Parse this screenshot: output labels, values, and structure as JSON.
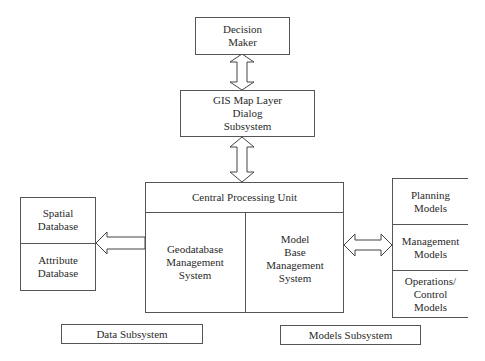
{
  "diagram": {
    "decision_maker": {
      "line1": "Decision",
      "line2": "Maker"
    },
    "gis_dialog": {
      "line1": "GIS Map Layer",
      "line2": "Dialog",
      "line3": "Subsystem"
    },
    "cpu": {
      "title": "Central Processing Unit",
      "left": {
        "line1": "Geodatabase",
        "line2": "Management",
        "line3": "System"
      },
      "right": {
        "line1": "Model",
        "line2": "Base",
        "line3": "Management",
        "line4": "System"
      }
    },
    "databases": [
      {
        "line1": "Spatial",
        "line2": "Database"
      },
      {
        "line1": "Attribute",
        "line2": "Database"
      }
    ],
    "models": [
      {
        "line1": "Planning",
        "line2": "Models"
      },
      {
        "line1": "Management",
        "line2": "Models"
      },
      {
        "line1": "Operations/",
        "line2": "Control",
        "line3": "Models"
      }
    ],
    "labels": {
      "data_subsystem": "Data Subsystem",
      "models_subsystem": "Models Subsystem"
    },
    "connectors": [
      {
        "from": "Decision Maker",
        "to": "GIS Map Layer Dialog Subsystem",
        "type": "double-arrow"
      },
      {
        "from": "GIS Map Layer Dialog Subsystem",
        "to": "Central Processing Unit",
        "type": "double-arrow"
      },
      {
        "from": "Central Processing Unit",
        "to": "Data Subsystem",
        "type": "single-arrow"
      },
      {
        "from": "Central Processing Unit",
        "to": "Models Subsystem",
        "type": "double-arrow"
      }
    ]
  }
}
